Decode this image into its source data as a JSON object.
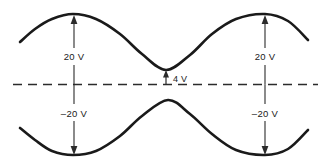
{
  "figure": {
    "background_color": "#ffffff",
    "curve_color": "#1a1a1a",
    "line_color": "#2b2b2b"
  },
  "annotations": {
    "upper_left_peak_label": "20 V",
    "upper_right_peak_label": "20 V",
    "lower_left_trough_label": "–20 V",
    "lower_right_trough_label": "–20 V",
    "center_offset_label": "4 V"
  },
  "chart_data": {
    "type": "line",
    "title": "",
    "xlabel": "",
    "ylabel": "",
    "xlim": [
      0,
      331
    ],
    "ylim": [
      168,
      0
    ],
    "grid": false,
    "legend": null,
    "axis": {
      "zero_line_y": 84.5,
      "zero_line_x_start": 13,
      "zero_line_x_end": 318,
      "zero_line_style": "dashed"
    },
    "series": [
      {
        "name": "upper-waveform",
        "description": "Upper cosine-like curve, peaks at 20 V, local minimum at 4 V",
        "points": [
          {
            "x": 20,
            "y": 42
          },
          {
            "x": 35,
            "y": 29
          },
          {
            "x": 52,
            "y": 19
          },
          {
            "x": 73,
            "y": 14
          },
          {
            "x": 96,
            "y": 19
          },
          {
            "x": 120,
            "y": 34
          },
          {
            "x": 142,
            "y": 54
          },
          {
            "x": 166,
            "y": 70
          },
          {
            "x": 190,
            "y": 55
          },
          {
            "x": 212,
            "y": 34
          },
          {
            "x": 236,
            "y": 19
          },
          {
            "x": 265,
            "y": 14
          },
          {
            "x": 288,
            "y": 21
          },
          {
            "x": 308,
            "y": 40
          }
        ]
      },
      {
        "name": "lower-waveform",
        "description": "Lower mirrored curve, troughs at -20 V",
        "points": [
          {
            "x": 20,
            "y": 128
          },
          {
            "x": 35,
            "y": 140
          },
          {
            "x": 52,
            "y": 151
          },
          {
            "x": 73,
            "y": 155
          },
          {
            "x": 96,
            "y": 151
          },
          {
            "x": 120,
            "y": 136
          },
          {
            "x": 142,
            "y": 116
          },
          {
            "x": 168,
            "y": 100
          },
          {
            "x": 190,
            "y": 114
          },
          {
            "x": 212,
            "y": 134
          },
          {
            "x": 236,
            "y": 150
          },
          {
            "x": 265,
            "y": 155
          },
          {
            "x": 288,
            "y": 149
          },
          {
            "x": 308,
            "y": 130
          }
        ]
      }
    ],
    "dimension_arrows": [
      {
        "name": "upper-left-20v",
        "x": 74,
        "from_y": 84.5,
        "to_y": 16,
        "label": "20 V",
        "direction": "up"
      },
      {
        "name": "upper-right-20v",
        "x": 265,
        "from_y": 84.5,
        "to_y": 16,
        "label": "20 V",
        "direction": "up"
      },
      {
        "name": "lower-left-minus20v",
        "x": 74,
        "from_y": 84.5,
        "to_y": 153,
        "label": "–20 V",
        "direction": "down"
      },
      {
        "name": "lower-right-minus20v",
        "x": 265,
        "from_y": 84.5,
        "to_y": 153,
        "label": "–20 V",
        "direction": "down"
      },
      {
        "name": "center-4v",
        "x": 166,
        "from_y": 84.5,
        "to_y": 71,
        "label": "4 V",
        "direction": "up"
      }
    ]
  }
}
